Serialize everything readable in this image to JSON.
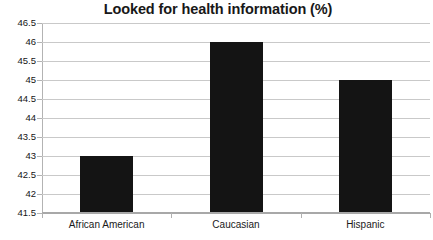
{
  "chart_data": {
    "type": "bar",
    "title": "Looked for health information (%)",
    "xlabel": "",
    "ylabel": "",
    "categories": [
      "African American",
      "Caucasian",
      "Hispanic"
    ],
    "values": [
      43,
      46,
      45
    ],
    "ylim": [
      41.5,
      46.5
    ],
    "ytick_step": 0.5,
    "ytick_labels": [
      "46.5",
      "46",
      "45.5",
      "45",
      "44.5",
      "44",
      "43.5",
      "43",
      "42.5",
      "42",
      "41.5"
    ],
    "ytick_values": [
      46.5,
      46,
      45.5,
      45,
      44.5,
      44,
      43.5,
      43,
      42.5,
      42,
      41.5
    ],
    "grid": true,
    "legend": false,
    "legend_position": "none",
    "series": [
      {
        "name": "Looked for health information (%)",
        "values": [
          43,
          46,
          45
        ],
        "color": "#141414"
      }
    ],
    "colors": {
      "bar": "#141414",
      "gridline": "#c9c9c9",
      "axis": "#a8a8a8",
      "title_text": "#181818",
      "tick_text": "#151515",
      "background": "#ffffff"
    }
  }
}
